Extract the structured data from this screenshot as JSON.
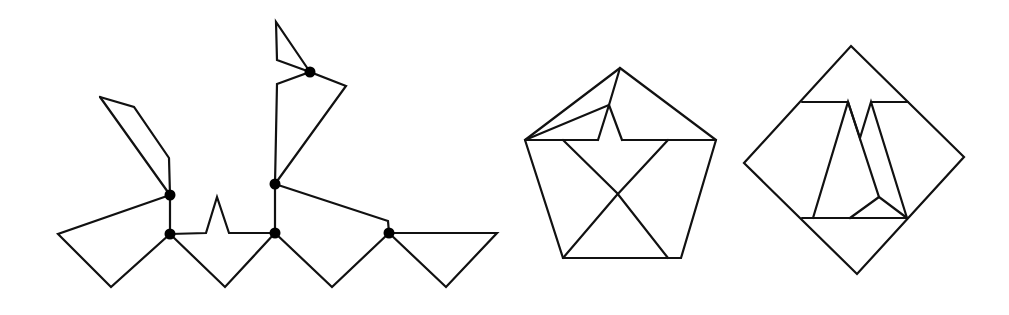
{
  "figure": {
    "stroke_color": "#111111",
    "node_color": "#000000",
    "background": "#ffffff",
    "panels": [
      {
        "id": "hinged-dissection",
        "paths": [
          "M100,97 L134,107 L169,158 L170,195",
          "M100,97 L170,195",
          "M170,195 L58,234 L111,287 L170,234",
          "M170,195 L170,234",
          "M170,234 L206,233 L217,197 L229,233 L275,233",
          "M170,234 L225,287 L275,233",
          "M275,233 L275,184",
          "M275,184 L277,84 L310,72 L346,86 L275,184",
          "M310,72 L277,60 L276,22 L310,72",
          "M275,184 L388,221 L389,233",
          "M275,233 L332,287 L389,233",
          "M389,233 L497,233 L446,287 L389,233"
        ],
        "nodes": [
          {
            "x": 170,
            "y": 195
          },
          {
            "x": 170,
            "y": 234
          },
          {
            "x": 275,
            "y": 233
          },
          {
            "x": 275,
            "y": 184
          },
          {
            "x": 310,
            "y": 72
          },
          {
            "x": 389,
            "y": 233
          }
        ]
      },
      {
        "id": "pentagon",
        "paths": [
          "M620,68 L716,140 L681,258 L563,258 L525,140 Z",
          "M525,140 L609,105 L620,68",
          "M609,105 L598,140",
          "M609,105 L622,140",
          "M525,140 L598,140",
          "M622,140 L716,140",
          "M563,140 L617,193 L668,258",
          "M668,140 L616,196 L563,258"
        ],
        "nodes": []
      },
      {
        "id": "square",
        "paths": [
          "M851,46 L964,157 L857,274 L744,163 Z",
          "M802,102 L848,102",
          "M872,102 L908,102",
          "M802,218 L907,218",
          "M813,218 L848,102 L860,138 L871,102 L907,218",
          "M848,102 L879,197 L907,218",
          "M879,197 L850,218"
        ],
        "nodes": []
      }
    ]
  }
}
